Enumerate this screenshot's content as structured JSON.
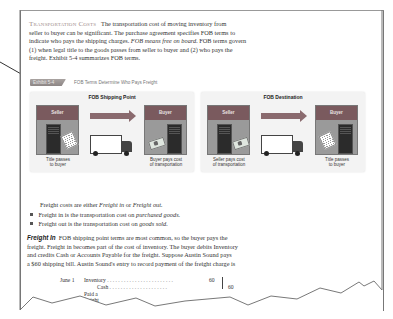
{
  "section": {
    "heading": "Transportation Costs",
    "intro_paragraph": [
      "The transportation cost of moving inventory from",
      "seller to buyer can be significant. The purchase agreement specifies FOB terms to",
      "indicate who pays the shipping charges.",
      "FOB means",
      "free on board.",
      "FOB terms govern",
      "(1) when legal title to the goods passes from seller to buyer and (2) who pays the",
      "freight. Exhibit 5-4 summarizes FOB terms."
    ]
  },
  "exhibit": {
    "badge": "Exhibit 5-4",
    "title": "FOB Terms Determine Who Pays Freight",
    "panels": [
      {
        "title": "FOB Shipping Point",
        "left_party": "Seller",
        "right_party": "Buyer",
        "left_caption": [
          "Title passes",
          "to buyer"
        ],
        "right_caption": [
          "Buyer pays cost",
          "of transportation"
        ],
        "left_icon": "document-icon",
        "right_icon": "money-icon"
      },
      {
        "title": "FOB Destination",
        "left_party": "Seller",
        "right_party": "Buyer",
        "left_caption": [
          "Seller pays cost",
          "of transportation"
        ],
        "right_caption": [
          "Title passes",
          "to buyer"
        ],
        "left_icon": "money-icon",
        "right_icon": "document-icon"
      }
    ]
  },
  "freight_types": {
    "lead": "Freight costs are either",
    "term1": "Freight in",
    "or": "or",
    "term2": "Freight out.",
    "bullets": [
      {
        "text": "Freight in is the transportation cost on",
        "emph": "purchased goods."
      },
      {
        "text": "Freight out is the transportation cost on",
        "emph": "goods sold."
      }
    ]
  },
  "freight_in": {
    "heading": "Freight In",
    "lines": [
      "FOB shipping point terms are most common, so the buyer pays the",
      "freight. Freight in becomes part of the cost of inventory. The buyer debits Inventory",
      "and credits Cash or Accounts Payable for the freight. Suppose Austin Sound pays",
      "a $60 shipping bill. Austin Sound's entry to record payment of the freight charge is"
    ]
  },
  "journal_entry": {
    "date": "June 1",
    "debit_account": "Inventory",
    "debit_amount": "60",
    "credit_account": "Cash",
    "credit_amount": "60",
    "explanation": "Paid a freight bill."
  },
  "colors": {
    "heading": "#a08c8a",
    "party_header": "#7a5a5e",
    "arrow": "#8a6a6e",
    "frame": "#777777"
  }
}
